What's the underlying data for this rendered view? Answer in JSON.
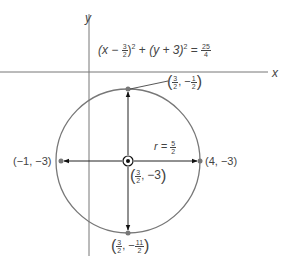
{
  "axes": {
    "x_label": "x",
    "y_label": "y"
  },
  "equation": {
    "lhs1_open": "(x − ",
    "lhs1_frac_num": "3",
    "lhs1_frac_den": "2",
    "lhs1_close": ")",
    "exp": "2",
    "plus": " + ",
    "lhs2": "(y + 3)",
    "equals": " = ",
    "rhs_num": "25",
    "rhs_den": "4"
  },
  "radius": {
    "label": "r = ",
    "num": "5",
    "den": "2"
  },
  "points": {
    "top": {
      "x_num": "3",
      "x_den": "2",
      "y_sign": "−",
      "y_num": "1",
      "y_den": "2"
    },
    "bottom": {
      "x_num": "3",
      "x_den": "2",
      "y_sign": "−",
      "y_num": "11",
      "y_den": "2"
    },
    "left": {
      "label": "(−1, −3)"
    },
    "right": {
      "label": "(4, −3)"
    },
    "center": {
      "x_num": "3",
      "x_den": "2",
      "y_val": "−3"
    }
  },
  "colors": {
    "circle": "#777777",
    "axes": "#666666",
    "arrows": "#111111",
    "points": "#777777"
  }
}
